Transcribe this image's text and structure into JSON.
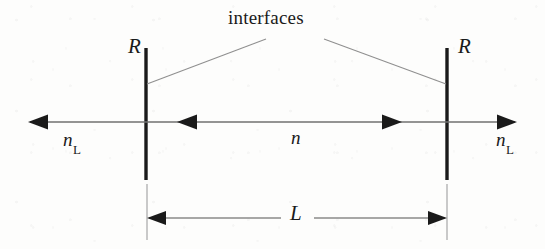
{
  "figure": {
    "width": 545,
    "height": 249,
    "background_color": "#fdfdfc",
    "ink_color": "#1a1a1a",
    "leader_color": "#8a8a8a",
    "axis_color": "#6e6e6e"
  },
  "labels": {
    "interfaces": "interfaces",
    "reflectivity_left": "R",
    "reflectivity_right": "R",
    "index_outer_left_symbol": "n",
    "index_outer_left_subscript": "L",
    "index_outer_right_symbol": "n",
    "index_outer_right_subscript": "L",
    "index_inner": "n",
    "length": "L"
  },
  "geometry": {
    "mirror_left_x": 146,
    "mirror_right_x": 447,
    "mirror_top_y": 48,
    "mirror_bottom_y": 180,
    "axis_y": 122,
    "dimension_y": 218,
    "extension_top_y": 184,
    "extension_bottom_y": 240,
    "axis_left_end_x": 28,
    "axis_right_end_x": 517,
    "inner_arrow_left_x": 177,
    "inner_arrow_right_x": 402,
    "leader_apex_left_x": 265,
    "leader_apex_right_x": 325,
    "leader_apex_y": 38,
    "dimension_gap_left_x": 281,
    "dimension_gap_right_x": 314
  },
  "arrows": [
    {
      "name": "outer-left-arrow",
      "direction": "left",
      "tip_x": 28,
      "y": 122
    },
    {
      "name": "inner-left-arrow",
      "direction": "left",
      "tip_x": 177,
      "y": 122
    },
    {
      "name": "inner-right-arrow",
      "direction": "right",
      "tip_x": 402,
      "y": 122
    },
    {
      "name": "outer-right-arrow",
      "direction": "right",
      "tip_x": 517,
      "y": 122
    },
    {
      "name": "dimension-left-arrow",
      "direction": "left",
      "tip_x": 147,
      "y": 218
    },
    {
      "name": "dimension-right-arrow",
      "direction": "right",
      "tip_x": 447,
      "y": 218
    }
  ]
}
